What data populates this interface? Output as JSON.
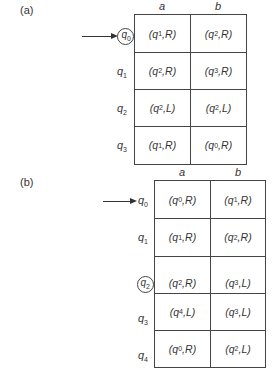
{
  "figure_a": {
    "label": "(a)",
    "columns": [
      "a",
      "b"
    ],
    "start_state": "q0",
    "circled_state": "q0",
    "rows": [
      {
        "state": "q",
        "sub": "0",
        "cells": [
          [
            "q",
            "1",
            "R"
          ],
          [
            "q",
            "2",
            "R"
          ]
        ]
      },
      {
        "state": "q",
        "sub": "1",
        "cells": [
          [
            "q",
            "2",
            "R"
          ],
          [
            "q",
            "3",
            "R"
          ]
        ]
      },
      {
        "state": "q",
        "sub": "2",
        "cells": [
          [
            "q",
            "2",
            "L"
          ],
          [
            "q",
            "2",
            "L"
          ]
        ]
      },
      {
        "state": "q",
        "sub": "3",
        "cells": [
          [
            "q",
            "1",
            "R"
          ],
          [
            "q",
            "0",
            "R"
          ]
        ]
      }
    ]
  },
  "figure_b": {
    "label": "(b)",
    "columns": [
      "a",
      "b"
    ],
    "start_state": "q0",
    "circled_state": "q2",
    "rows": [
      {
        "state": "q",
        "sub": "0",
        "cells": [
          [
            "q",
            "0",
            "R"
          ],
          [
            "q",
            "1",
            "R"
          ]
        ]
      },
      {
        "state": "q",
        "sub": "1",
        "cells": [
          [
            "q",
            "1",
            "R"
          ],
          [
            "q",
            "2",
            "R"
          ]
        ]
      },
      {
        "state": "q",
        "sub": "2",
        "cells": [
          [
            "q",
            "2",
            "R"
          ],
          [
            "q",
            "3",
            "L"
          ]
        ]
      },
      {
        "state": "q",
        "sub": "3",
        "cells": [
          [
            "q",
            "4",
            "L"
          ],
          [
            "q",
            "3",
            "L"
          ]
        ]
      },
      {
        "state": "q",
        "sub": "4",
        "cells": [
          [
            "q",
            "0",
            "R"
          ],
          [
            "q",
            "2",
            "L"
          ]
        ]
      }
    ]
  }
}
